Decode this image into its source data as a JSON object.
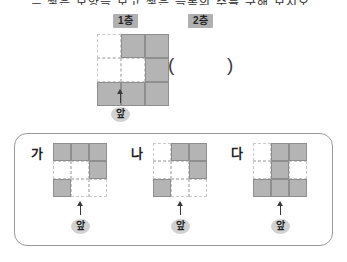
{
  "header": {
    "cut_text": "─ 쌓은 모양을 보고 쌓은 블록의 수를 구해 보시오."
  },
  "floor_labels": {
    "first": "1층",
    "second": "2층"
  },
  "answer_blank": {
    "open_paren": "(",
    "close_paren": ")",
    "value": "",
    "spacer": "          "
  },
  "front_marker": {
    "label": "앞",
    "icon": "up-arrow-icon"
  },
  "main_plan": {
    "name": "1층",
    "rows": 3,
    "cols": 3,
    "cells": [
      [
        "empty",
        "fill",
        "fill"
      ],
      [
        "empty",
        "empty",
        "fill"
      ],
      [
        "fill",
        "fill",
        "fill"
      ]
    ]
  },
  "options": [
    {
      "id": "ga",
      "label": "가",
      "rows": 3,
      "cols": 3,
      "cells": [
        [
          "fill",
          "fill",
          "fill"
        ],
        [
          "empty",
          "empty",
          "fill"
        ],
        [
          "fill",
          "empty",
          "empty"
        ]
      ],
      "front_label": "앞"
    },
    {
      "id": "na",
      "label": "나",
      "rows": 3,
      "cols": 3,
      "cells": [
        [
          "empty",
          "fill",
          "fill"
        ],
        [
          "empty",
          "empty",
          "fill"
        ],
        [
          "fill",
          "empty",
          "empty"
        ]
      ],
      "front_label": "앞"
    },
    {
      "id": "da",
      "label": "다",
      "rows": 3,
      "cols": 3,
      "cells": [
        [
          "empty",
          "fill",
          "fill"
        ],
        [
          "empty",
          "fill",
          "empty"
        ],
        [
          "fill",
          "fill",
          "fill"
        ]
      ],
      "front_label": "앞"
    }
  ],
  "colors": {
    "cell_fill": "#b4b4b4",
    "cell_fill_border": "#8e8e8e",
    "cell_empty_border": "#c9c9c9",
    "badge_bg": "#b0b0b0",
    "oval_bg": "#d2d2d2",
    "box_border": "#9a9a9a"
  }
}
